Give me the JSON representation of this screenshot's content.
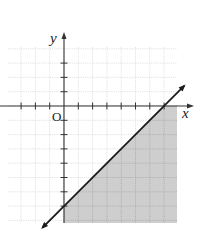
{
  "chart_data": {
    "type": "line",
    "title": "",
    "subtitle": "",
    "xlabel": "x",
    "ylabel": "y",
    "origin_label": "O",
    "xlim": [
      -4,
      8
    ],
    "ylim": [
      -8,
      4
    ],
    "grid": true,
    "legend": null,
    "x_ticks_count_left": 3,
    "x_ticks_count_right": 7,
    "y_ticks_count_up": 3,
    "y_ticks_count_down": 7,
    "boundary_line": {
      "equation": "y = x - 7",
      "slope": 1,
      "intercept": -7,
      "style": "solid",
      "arrows": "both",
      "points": [
        [
          0,
          -7
        ],
        [
          7,
          0
        ]
      ]
    },
    "shaded_region": {
      "inequality": "y <= x - 7",
      "side": "below",
      "x_range": [
        0,
        8
      ],
      "y_range": [
        -8,
        0
      ],
      "vertices": [
        [
          0,
          -7
        ],
        [
          0,
          -8
        ],
        [
          8,
          -8
        ],
        [
          8,
          0
        ],
        [
          7,
          0
        ]
      ]
    },
    "colors": {
      "shade": "#c9c9c9",
      "grid": "#d6d6d6",
      "axis": "#333333",
      "line": "#1a1a1a"
    }
  },
  "layout": {
    "origin_px": [
      64,
      106
    ],
    "unit_px": 14.3,
    "grid_px": {
      "left": 8,
      "top": 47,
      "right": 177,
      "bottom": 223
    }
  }
}
